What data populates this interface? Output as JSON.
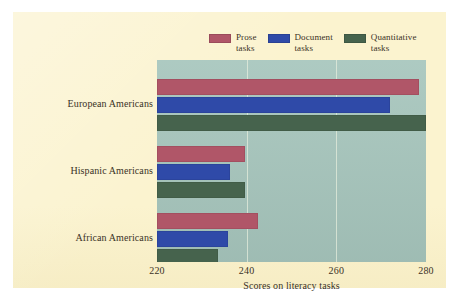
{
  "figure": {
    "paper_color": "#fbf3cf",
    "plot_background": "#a7c6bd",
    "gridline_color": "#e8f0de"
  },
  "legend": {
    "position": "top-center",
    "entries": [
      {
        "label": "Prose\ntasks",
        "color": "#b05668",
        "name": "prose"
      },
      {
        "label": "Document\ntasks",
        "color": "#2f4aa8",
        "name": "document"
      },
      {
        "label": "Quantitative\ntasks",
        "color": "#46634d",
        "name": "quantitative"
      }
    ]
  },
  "chart_data": {
    "type": "bar",
    "orientation": "horizontal",
    "title": "",
    "subtitle": "",
    "xlabel": "Scores on literacy tasks",
    "ylabel": "",
    "categories": [
      "European Americans",
      "Hispanic Americans",
      "African Americans"
    ],
    "series": [
      {
        "name": "Prose tasks",
        "color": "#b05668",
        "values": [
          278.5,
          239.7,
          242.6
        ]
      },
      {
        "name": "Document tasks",
        "color": "#2f4aa8",
        "values": [
          272.0,
          236.3,
          235.8
        ]
      },
      {
        "name": "Quantitative tasks",
        "color": "#46634d",
        "values": [
          280.0,
          239.7,
          233.5
        ]
      }
    ],
    "xlim": [
      220,
      280
    ],
    "xticks": [
      220,
      240,
      260,
      280
    ],
    "xtick_labels": [
      "220",
      "240",
      "260",
      "280"
    ],
    "grid": "vertical-only",
    "legend_position": "top-center"
  }
}
